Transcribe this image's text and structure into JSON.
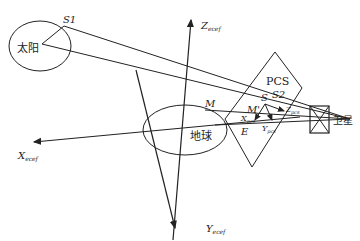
{
  "diagram": {
    "sun": {
      "label": "太阳",
      "point": "S1"
    },
    "earth": {
      "label": "地球",
      "point_m": "M",
      "point_e": "E"
    },
    "satellite": {
      "label": "卫星"
    },
    "plane": {
      "label": "PCS"
    },
    "points": {
      "s": "S",
      "s2": "S2",
      "m_prime": "M'"
    },
    "axes": {
      "x_ecef": {
        "main": "X",
        "sub": "ecef"
      },
      "y_ecef": {
        "main": "Y",
        "sub": "ecef"
      },
      "z_ecef": {
        "main": "Z",
        "sub": "ecef"
      },
      "x_pcs": {
        "main": "X",
        "sub": "pcs"
      },
      "y_pcs": {
        "main": "Y",
        "sub": "pcs"
      },
      "z_pcs": {
        "main": "Z",
        "sub": "pcs"
      }
    },
    "colors": {
      "stroke": "#222222",
      "background": "#ffffff"
    }
  }
}
